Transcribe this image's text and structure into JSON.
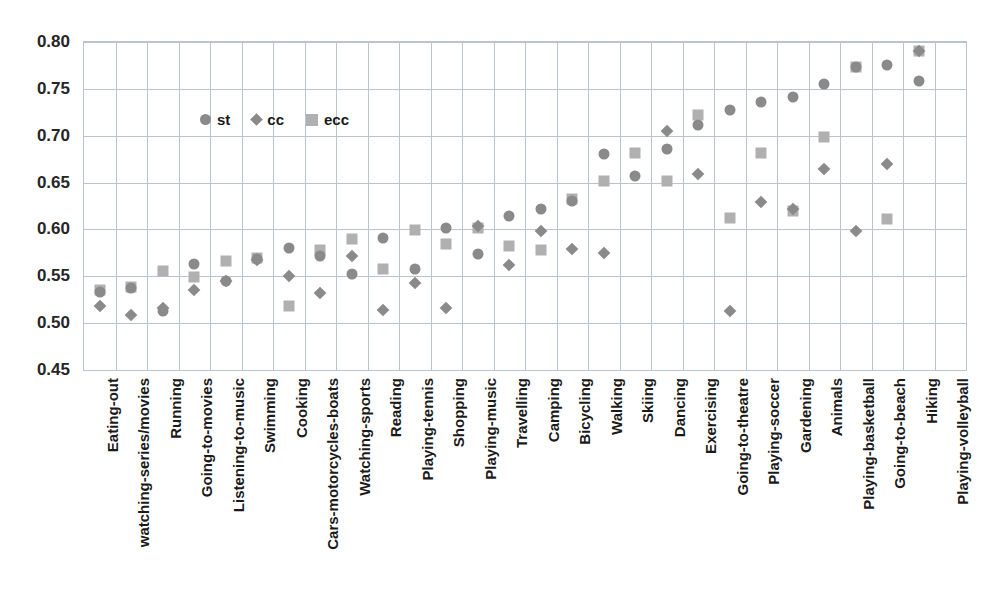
{
  "chart_data": {
    "type": "scatter",
    "title": "",
    "subtitle": "",
    "xlabel": "",
    "ylabel": "",
    "ylim": [
      0.45,
      0.8
    ],
    "ytick_labels": [
      "0.80",
      "0.75",
      "0.70",
      "0.65",
      "0.60",
      "0.55",
      "0.50",
      "0.45"
    ],
    "ytick_values": [
      0.8,
      0.75,
      0.7,
      0.65,
      0.6,
      0.55,
      0.5,
      0.45
    ],
    "grid": true,
    "legend_position": "inside-top-left",
    "legend": [
      {
        "name": "st",
        "marker": "circle",
        "color": "#8a8a8a"
      },
      {
        "name": "cc",
        "marker": "diamond",
        "color": "#8a8a8a"
      },
      {
        "name": "ecc",
        "marker": "square",
        "color": "#b0b0b0"
      }
    ],
    "categories": [
      "Eating-out",
      "watching-series/movies",
      "Running",
      "Going-to-movies",
      "Listening-to-music",
      "Swimming",
      "Cooking",
      "Cars-motorcycles-boats",
      "Watching-sports",
      "Reading",
      "Playing-tennis",
      "Shopping",
      "Playing-music",
      "Travelling",
      "Camping",
      "Bicycling",
      "Walking",
      "Skiing",
      "Dancing",
      "Exercising",
      "Going-to-theatre",
      "Playing-soccer",
      "Gardening",
      "Animals",
      "Playing-basketball",
      "Going-to-beach",
      "Hiking",
      "Playing-volleyball"
    ],
    "series": [
      {
        "name": "st",
        "marker": "circle",
        "color": "#8a8a8a",
        "values": [
          0.533,
          0.537,
          0.513,
          0.563,
          0.545,
          0.568,
          0.58,
          0.572,
          0.552,
          0.591,
          0.558,
          0.601,
          0.574,
          0.614,
          0.622,
          0.63,
          0.68,
          0.657,
          0.686,
          0.711,
          0.727,
          0.736,
          0.741,
          0.755,
          0.773,
          0.775,
          0.758,
          null
        ]
      },
      {
        "name": "cc",
        "marker": "diamond",
        "color": "#8a8a8a",
        "values": [
          0.518,
          0.509,
          0.516,
          0.535,
          0.545,
          0.567,
          0.55,
          0.532,
          0.572,
          0.514,
          0.543,
          0.516,
          0.604,
          0.562,
          0.598,
          0.579,
          0.575,
          null,
          0.705,
          0.659,
          0.513,
          0.629,
          0.622,
          0.665,
          0.598,
          0.67,
          0.79,
          null
        ]
      },
      {
        "name": "ecc",
        "marker": "square",
        "color": "#b0b0b0",
        "values": [
          0.535,
          0.539,
          0.556,
          0.549,
          0.566,
          0.569,
          0.518,
          0.578,
          0.59,
          0.558,
          0.599,
          0.584,
          0.601,
          0.582,
          0.578,
          0.632,
          0.652,
          0.682,
          0.652,
          0.722,
          0.612,
          0.682,
          0.62,
          0.699,
          0.773,
          0.611,
          0.79,
          null
        ]
      }
    ]
  }
}
